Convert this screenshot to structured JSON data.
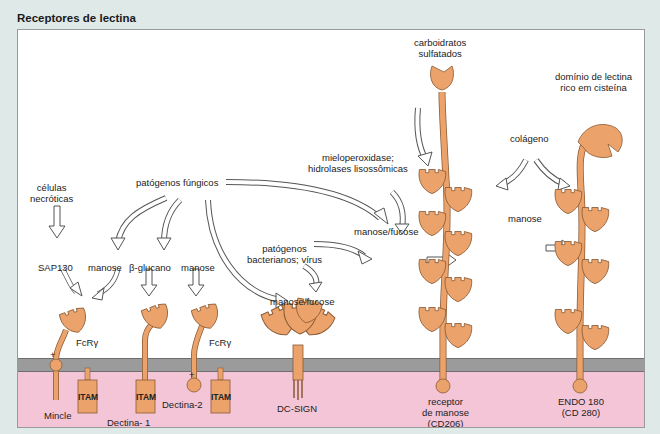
{
  "title": "Receptores de lectina",
  "colors": {
    "background": "#dfe9e8",
    "panel": "#ffffff",
    "protein": "#eba36b",
    "protein_outline": "#8a5a34",
    "membrane": "#9b9b9b",
    "cytoplasm": "#f3c5d7",
    "arrow_fill": "#ffffff",
    "arrow_outline": "#555555"
  },
  "ligands": {
    "necrotic_cells": "células\nnecróticas",
    "fungal_pathogens": "patógenos fúngicos",
    "sap130": "SAP130",
    "mannose_1": "manose",
    "beta_glucan": "β-glucano",
    "mannose_2": "manose",
    "bacterial_viral": "patógenos\nbacterianos; vírus",
    "mannose_fucose_1": "manose/fucose",
    "myeloperoxidase": "mieloperoxidase;\nhidrolases lisossômicas",
    "mannose_fucose_2": "manose/fucose",
    "sulfated_carbs": "carboidratos\nsulfatados",
    "collagen": "colágeno",
    "mannose_3": "manose",
    "ctld_domain": "domínio de lectina\nrico em cisteína"
  },
  "receptors": {
    "mincle": "Mincle",
    "fcr_gamma_1": "FcRγ",
    "dectin1": "Dectina- 1",
    "dectin2": "Dectina-2",
    "fcr_gamma_2": "FcRγ",
    "dcsign": "DC-SIGN",
    "mannose_receptor": "receptor\nde manose\n(CD206)",
    "endo180": "ENDO 180\n(CD 280)"
  },
  "motifs": {
    "itam": "ITAM",
    "plus": "+"
  }
}
